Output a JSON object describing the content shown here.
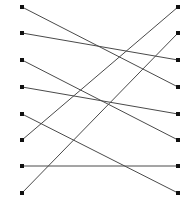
{
  "diagram": {
    "type": "bipartite-graph",
    "canvas": {
      "width": 194,
      "height": 209,
      "background": "#ffffff"
    },
    "style": {
      "edge_color": "#4a4a4a",
      "edge_width": 1,
      "node_color": "#111111",
      "node_size": 4,
      "node_shape": "square"
    },
    "left_column_x": 22,
    "right_column_x": 178,
    "left_nodes": [
      {
        "id": "L1",
        "x": 22,
        "y": 7
      },
      {
        "id": "L2",
        "x": 22,
        "y": 33
      },
      {
        "id": "L3",
        "x": 22,
        "y": 60
      },
      {
        "id": "L4",
        "x": 22,
        "y": 87
      },
      {
        "id": "L5",
        "x": 22,
        "y": 114
      },
      {
        "id": "L6",
        "x": 22,
        "y": 140
      },
      {
        "id": "L7",
        "x": 22,
        "y": 166
      },
      {
        "id": "L8",
        "x": 22,
        "y": 193
      }
    ],
    "right_nodes": [
      {
        "id": "R1",
        "x": 178,
        "y": 7
      },
      {
        "id": "R2",
        "x": 178,
        "y": 33
      },
      {
        "id": "R3",
        "x": 178,
        "y": 60
      },
      {
        "id": "R4",
        "x": 178,
        "y": 87
      },
      {
        "id": "R5",
        "x": 178,
        "y": 114
      },
      {
        "id": "R6",
        "x": 178,
        "y": 140
      },
      {
        "id": "R7",
        "x": 178,
        "y": 166
      },
      {
        "id": "R8",
        "x": 178,
        "y": 193
      }
    ],
    "edges": [
      {
        "from": "L1",
        "to": "R4",
        "x1": 22,
        "y1": 7,
        "x2": 178,
        "y2": 87
      },
      {
        "from": "L2",
        "to": "R3",
        "x1": 22,
        "y1": 33,
        "x2": 178,
        "y2": 60
      },
      {
        "from": "L3",
        "to": "R6",
        "x1": 22,
        "y1": 60,
        "x2": 178,
        "y2": 140
      },
      {
        "from": "L4",
        "to": "R5",
        "x1": 22,
        "y1": 87,
        "x2": 178,
        "y2": 114
      },
      {
        "from": "L5",
        "to": "R8",
        "x1": 22,
        "y1": 114,
        "x2": 178,
        "y2": 193
      },
      {
        "from": "L6",
        "to": "R1",
        "x1": 22,
        "y1": 140,
        "x2": 178,
        "y2": 7
      },
      {
        "from": "L7",
        "to": "R7",
        "x1": 22,
        "y1": 166,
        "x2": 178,
        "y2": 166
      },
      {
        "from": "L8",
        "to": "R2",
        "x1": 22,
        "y1": 193,
        "x2": 178,
        "y2": 33
      }
    ],
    "node_count_left": 8,
    "node_count_right": 8,
    "edge_count": 8
  }
}
